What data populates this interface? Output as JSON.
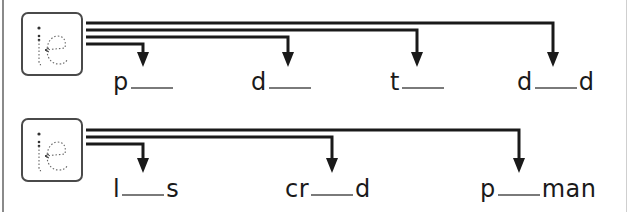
{
  "worksheet": {
    "rows": [
      {
        "tile": {
          "letters": "ie",
          "icon": "traced-letters-ie"
        },
        "words": [
          {
            "before": "p",
            "after": "",
            "blank_width": 42,
            "x": 113,
            "arrow_x": 143
          },
          {
            "before": "d",
            "after": "",
            "blank_width": 42,
            "x": 251,
            "arrow_x": 288
          },
          {
            "before": "t",
            "after": "",
            "blank_width": 42,
            "x": 390,
            "arrow_x": 417
          },
          {
            "before": "d",
            "after": "d",
            "blank_width": 42,
            "x": 517,
            "arrow_x": 553
          }
        ]
      },
      {
        "tile": {
          "letters": "ie",
          "icon": "traced-letters-ie"
        },
        "words": [
          {
            "before": "l",
            "after": "s",
            "blank_width": 42,
            "x": 113,
            "arrow_x": 143
          },
          {
            "before": "cr",
            "after": "d",
            "blank_width": 42,
            "x": 285,
            "arrow_x": 332
          },
          {
            "before": "p",
            "after": "man",
            "blank_width": 42,
            "x": 480,
            "arrow_x": 519
          }
        ]
      }
    ],
    "colors": {
      "line": "#1a1a1a",
      "tile_border": "#4a4a4a",
      "blank": "#7a7a7a",
      "trace": "#555555"
    }
  }
}
